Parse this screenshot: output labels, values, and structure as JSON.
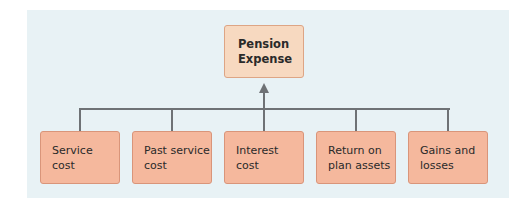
{
  "diagram": {
    "title_node": {
      "line1": "Pension",
      "line2": "Expense"
    },
    "components": [
      {
        "line1": "Service",
        "line2": "cost"
      },
      {
        "line1": "Past service",
        "line2": "cost"
      },
      {
        "line1": "Interest",
        "line2": "cost"
      },
      {
        "line1": "Return on",
        "line2": "plan assets"
      },
      {
        "line1": "Gains and",
        "line2": "losses"
      }
    ],
    "colors": {
      "panel_background": "#e8f2f5",
      "top_node_fill": "#f7d9c0",
      "component_fill": "#f5b89d",
      "connector": "#6e7275"
    }
  }
}
